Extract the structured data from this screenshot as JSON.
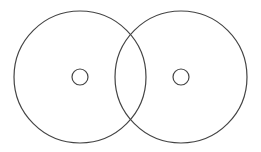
{
  "canvas": {
    "width": 261,
    "height": 152,
    "background": "#ffffff"
  },
  "stroke": {
    "color": "#444444",
    "width": 1.2
  },
  "disks": [
    {
      "name": "left-disk",
      "outer": {
        "cx": 80,
        "cy": 77,
        "r": 66
      },
      "hole": {
        "cx": 80,
        "cy": 77,
        "r": 8
      }
    },
    {
      "name": "right-disk",
      "outer": {
        "cx": 181,
        "cy": 77,
        "r": 66
      },
      "hole": {
        "cx": 181,
        "cy": 77,
        "r": 8
      }
    }
  ]
}
